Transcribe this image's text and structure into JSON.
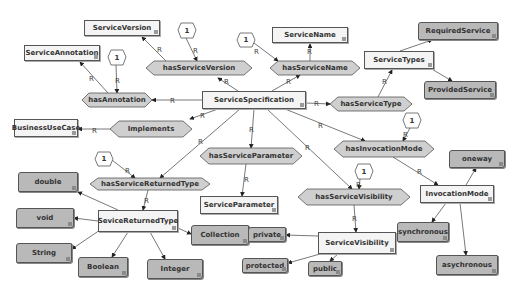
{
  "nodes": {
    "ServiceVersion": {
      "label": "ServiceVersion",
      "type": "class",
      "x": 84,
      "y": 20,
      "w": 76,
      "h": 16
    },
    "ServiceAnnotation": {
      "label": "ServiceAnnotation",
      "type": "class",
      "x": 24,
      "y": 45,
      "w": 76,
      "h": 16
    },
    "ServiceName": {
      "label": "ServiceName",
      "type": "class",
      "x": 272,
      "y": 27,
      "w": 76,
      "h": 16
    },
    "ServiceTypes": {
      "label": "ServiceTypes",
      "type": "class",
      "x": 364,
      "y": 51,
      "w": 70,
      "h": 18
    },
    "ServiceSpecification": {
      "label": "ServiceSpecification",
      "type": "class",
      "x": 202,
      "y": 91,
      "w": 104,
      "h": 18
    },
    "BusinessUseCase": {
      "label": "BusinessUseCase",
      "type": "class",
      "x": 14,
      "y": 119,
      "w": 64,
      "h": 18
    },
    "ServiceParameter": {
      "label": "ServiceParameter",
      "type": "class",
      "x": 200,
      "y": 196,
      "w": 78,
      "h": 18
    },
    "SeviceReturnedType": {
      "label": "SeviceReturnedType",
      "type": "class",
      "x": 98,
      "y": 210,
      "w": 80,
      "h": 22
    },
    "ServiceVisibility": {
      "label": "ServiceVisibility",
      "type": "class",
      "x": 318,
      "y": 232,
      "w": 78,
      "h": 22
    },
    "InvocationMode": {
      "label": "InvocationMode",
      "type": "class",
      "x": 420,
      "y": 185,
      "w": 74,
      "h": 18
    },
    "RequiredService": {
      "label": "RequiredService",
      "type": "individual",
      "x": 418,
      "y": 22,
      "w": 80,
      "h": 18
    },
    "ProvidedService": {
      "label": "ProvidedService",
      "type": "individual",
      "x": 424,
      "y": 81,
      "w": 72,
      "h": 18
    },
    "double": {
      "label": "double",
      "type": "individual",
      "x": 18,
      "y": 172,
      "w": 60,
      "h": 20
    },
    "void": {
      "label": "void",
      "type": "individual",
      "x": 16,
      "y": 208,
      "w": 58,
      "h": 20
    },
    "String": {
      "label": "String",
      "type": "individual",
      "x": 16,
      "y": 243,
      "w": 56,
      "h": 20
    },
    "Boolean": {
      "label": "Boolean",
      "type": "individual",
      "x": 78,
      "y": 257,
      "w": 50,
      "h": 20
    },
    "Integer": {
      "label": "Integer",
      "type": "individual",
      "x": 147,
      "y": 259,
      "w": 56,
      "h": 20
    },
    "Collection": {
      "label": "Collection",
      "type": "individual",
      "x": 191,
      "y": 225,
      "w": 58,
      "h": 20
    },
    "private": {
      "label": "private",
      "type": "individual",
      "x": 248,
      "y": 227,
      "w": 38,
      "h": 15
    },
    "protected": {
      "label": "protected",
      "type": "individual",
      "x": 242,
      "y": 258,
      "w": 46,
      "h": 15
    },
    "public": {
      "label": "public",
      "type": "individual",
      "x": 308,
      "y": 261,
      "w": 34,
      "h": 15
    },
    "oneway": {
      "label": "oneway",
      "type": "individual",
      "x": 449,
      "y": 150,
      "w": 56,
      "h": 18
    },
    "synchronous": {
      "label": "synchronous",
      "type": "individual",
      "x": 397,
      "y": 222,
      "w": 52,
      "h": 20
    },
    "asychronous": {
      "label": "asychronous",
      "type": "individual",
      "x": 436,
      "y": 255,
      "w": 62,
      "h": 20
    }
  },
  "properties": {
    "hasServiceVersion": {
      "label": "hasServiceVersion",
      "x": 146,
      "y": 61,
      "w": 106,
      "h": 14
    },
    "hasAnnotation": {
      "label": "hasAnnotation",
      "x": 82,
      "y": 93,
      "w": 70,
      "h": 14
    },
    "hasServiceName": {
      "label": "hasServiceName",
      "x": 270,
      "y": 61,
      "w": 90,
      "h": 14
    },
    "hasServiceType": {
      "label": "hasServiceType",
      "x": 330,
      "y": 97,
      "w": 82,
      "h": 14
    },
    "implements": {
      "label": "Implements",
      "x": 110,
      "y": 121,
      "w": 82,
      "h": 16
    },
    "hasServiceParameter": {
      "label": "hasServiceParameter",
      "x": 200,
      "y": 148,
      "w": 102,
      "h": 16
    },
    "hasInvocationMode": {
      "label": "hasInvocationMode",
      "x": 334,
      "y": 141,
      "w": 100,
      "h": 16
    },
    "hasServiceReturnedType": {
      "label": "hasServiceReturnedType",
      "x": 90,
      "y": 178,
      "w": 120,
      "h": 12
    },
    "hasServiceVisibility": {
      "label": "hasServiceVisibility",
      "x": 298,
      "y": 189,
      "w": 112,
      "h": 16
    }
  },
  "cardinalities": [
    {
      "value": "1",
      "x": 178,
      "y": 23
    },
    {
      "value": "1",
      "x": 237,
      "y": 33
    },
    {
      "value": "1",
      "x": 108,
      "y": 50
    },
    {
      "value": "1",
      "x": 403,
      "y": 113
    },
    {
      "value": "1",
      "x": 95,
      "y": 152
    },
    {
      "value": "1",
      "x": 355,
      "y": 164
    }
  ],
  "edge_label": "R",
  "individual_edge_label": "I",
  "colors": {
    "class_fill": "#f4f4f4",
    "individual_fill": "#b9b9b9",
    "property_fill": "#cfcfcf",
    "border": "#555555"
  }
}
